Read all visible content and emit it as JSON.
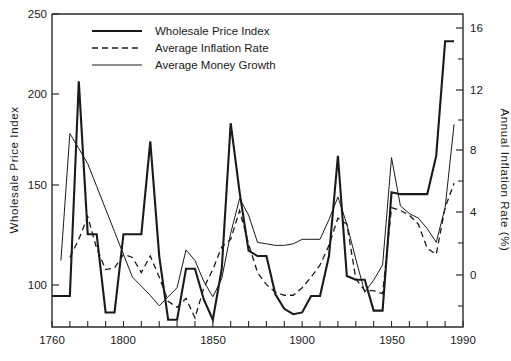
{
  "chart_data": {
    "type": "line",
    "title": "",
    "subtitle": "",
    "xlabel": "",
    "ylabel": "Wholesale  Price  Index",
    "y2label": "Annual  Inflation  Rate  (%)",
    "xlim": [
      1760,
      1990
    ],
    "ylim": [
      78,
      250
    ],
    "y2lim": [
      -3.2,
      17.5
    ],
    "grid": false,
    "legend_position": "top-left-inside",
    "xticks": [
      1760,
      1770,
      1780,
      1790,
      1800,
      1810,
      1820,
      1830,
      1840,
      1850,
      1860,
      1870,
      1880,
      1890,
      1900,
      1910,
      1920,
      1930,
      1940,
      1950,
      1960,
      1970,
      1980,
      1990
    ],
    "xticklabels": [
      "1760",
      "",
      "",
      "",
      "1800",
      "",
      "",
      "",
      "",
      "1850",
      "",
      "",
      "",
      "",
      "1900",
      "",
      "",
      "",
      "",
      "1950",
      "",
      "",
      "",
      "1990"
    ],
    "xticklabels_shown": [
      "1760",
      "1800",
      "1850",
      "1900",
      "1950",
      "1990"
    ],
    "yticks": [
      100,
      150,
      200,
      250
    ],
    "yticklabels": [
      "100",
      "150",
      "200",
      "250"
    ],
    "y2ticks": [
      -2,
      0,
      2,
      4,
      6,
      8,
      10,
      12,
      14,
      16
    ],
    "y2ticklabels": [
      "",
      "0",
      "",
      "4",
      "",
      "8",
      "",
      "12",
      "",
      "16"
    ],
    "y2ticklabels_shown": [
      "0",
      "4",
      "8",
      "12",
      "16"
    ],
    "series": [
      {
        "name": "Wholesale Price Index",
        "style": "solid-thick",
        "axis": "left",
        "x": [
          1760,
          1765,
          1770,
          1775,
          1780,
          1785,
          1790,
          1795,
          1800,
          1805,
          1810,
          1815,
          1820,
          1825,
          1830,
          1835,
          1840,
          1845,
          1850,
          1855,
          1860,
          1865,
          1870,
          1875,
          1880,
          1885,
          1890,
          1895,
          1900,
          1905,
          1910,
          1915,
          1920,
          1925,
          1930,
          1935,
          1940,
          1945,
          1950,
          1955,
          1960,
          1965,
          1970,
          1975,
          1980,
          1985
        ],
        "values": [
          95,
          95,
          95,
          213,
          129,
          129,
          86,
          86,
          129,
          129,
          129,
          180,
          117,
          82,
          82,
          110,
          110,
          93,
          82,
          110,
          190,
          152,
          120,
          117,
          117,
          96,
          88,
          85,
          86,
          95,
          95,
          117,
          172,
          106,
          104,
          104,
          87,
          87,
          152,
          151,
          151,
          151,
          151,
          172,
          235,
          235
        ]
      },
      {
        "name": "Average Inflation Rate",
        "style": "dashed",
        "axis": "right",
        "x": [
          1770,
          1775,
          1780,
          1785,
          1790,
          1795,
          1800,
          1805,
          1810,
          1815,
          1820,
          1825,
          1830,
          1835,
          1840,
          1845,
          1850,
          1855,
          1860,
          1865,
          1870,
          1875,
          1880,
          1885,
          1890,
          1895,
          1900,
          1905,
          1910,
          1915,
          1920,
          1925,
          1930,
          1935,
          1940,
          1945,
          1950,
          1955,
          1960,
          1965,
          1970,
          1975,
          1980,
          1985
        ],
        "values": [
          1.4,
          2.6,
          4.1,
          2.0,
          0.6,
          0.7,
          1.6,
          1.4,
          0.4,
          1.5,
          0.1,
          -1.5,
          -1.9,
          -1.3,
          -2.6,
          -0.6,
          0.6,
          2.1,
          2.6,
          4.5,
          2.3,
          0.4,
          -0.4,
          -0.9,
          -1.1,
          -1.1,
          -0.6,
          0.1,
          0.9,
          2.2,
          4.0,
          3.6,
          0.0,
          -0.8,
          -0.8,
          -1.0,
          4.7,
          4.5,
          4.2,
          3.6,
          2.0,
          1.6,
          4.7,
          6.3
        ]
      },
      {
        "name": "Average Money Growth",
        "style": "solid-thin",
        "axis": "right",
        "x": [
          1765,
          1770,
          1775,
          1780,
          1785,
          1790,
          1795,
          1800,
          1805,
          1810,
          1815,
          1820,
          1825,
          1830,
          1835,
          1840,
          1845,
          1850,
          1855,
          1860,
          1865,
          1870,
          1875,
          1880,
          1885,
          1890,
          1895,
          1900,
          1905,
          1910,
          1915,
          1920,
          1925,
          1930,
          1935,
          1940,
          1945,
          1950,
          1955,
          1960,
          1965,
          1970,
          1975,
          1980,
          1985
        ],
        "values": [
          1.2,
          9.6,
          8.6,
          7.6,
          6.1,
          4.6,
          3.1,
          1.6,
          0.1,
          -0.5,
          -1.1,
          -1.8,
          -1.2,
          -0.6,
          1.9,
          1.2,
          -0.2,
          -1.2,
          0.0,
          3.0,
          5.3,
          4.2,
          2.4,
          2.3,
          2.2,
          2.2,
          2.3,
          2.6,
          2.6,
          2.6,
          3.9,
          5.4,
          3.6,
          1.3,
          -0.9,
          -0.1,
          0.9,
          8.0,
          4.8,
          4.3,
          4.0,
          3.3,
          2.4,
          4.7,
          10.2
        ]
      }
    ]
  },
  "axes": {
    "left_title": "Wholesale  Price  Index",
    "right_title": "Annual  Inflation  Rate  (%)",
    "left_ticklabels": [
      "250",
      "200",
      "150",
      "100"
    ],
    "bottom_ticklabels": [
      "1760",
      "1800",
      "1850",
      "1900",
      "1950",
      "1990"
    ],
    "right_ticklabels": [
      "16",
      "12",
      "8",
      "4",
      "0"
    ]
  },
  "legend": {
    "items": [
      {
        "label": "Wholesale Price Index",
        "style": "solid-thick"
      },
      {
        "label": "Average Inflation Rate",
        "style": "dashed"
      },
      {
        "label": "Average Money Growth",
        "style": "solid-thin"
      }
    ]
  }
}
